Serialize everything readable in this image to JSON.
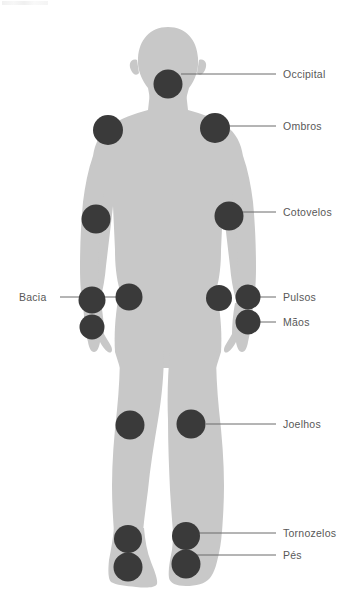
{
  "figure": {
    "body_color": "#c8c8c8",
    "marker_color": "#3a3a3a",
    "label_color": "#585858",
    "leader_color": "#6a6a6a",
    "background": "#ffffff"
  },
  "labels": [
    {
      "id": "occipital",
      "text": "Occipital",
      "side": "right",
      "x": 283,
      "y": 69,
      "line": {
        "x1": 181,
        "y1": 74,
        "x2": 276,
        "y2": 74
      }
    },
    {
      "id": "ombros",
      "text": "Ombros",
      "side": "right",
      "x": 283,
      "y": 121,
      "line": {
        "x1": 224,
        "y1": 126,
        "x2": 276,
        "y2": 126
      }
    },
    {
      "id": "cotovelos",
      "text": "Cotovelos",
      "side": "right",
      "x": 283,
      "y": 207,
      "line": {
        "x1": 239,
        "y1": 212,
        "x2": 276,
        "y2": 212
      }
    },
    {
      "id": "pulsos",
      "text": "Pulsos",
      "side": "right",
      "x": 283,
      "y": 292,
      "line": {
        "x1": 258,
        "y1": 297,
        "x2": 276,
        "y2": 297
      }
    },
    {
      "id": "maos",
      "text": "Mãos",
      "side": "right",
      "x": 283,
      "y": 317,
      "line": {
        "x1": 258,
        "y1": 322,
        "x2": 276,
        "y2": 322
      }
    },
    {
      "id": "joelhos",
      "text": "Joelhos",
      "side": "right",
      "x": 283,
      "y": 419,
      "line": {
        "x1": 206,
        "y1": 424,
        "x2": 276,
        "y2": 424
      }
    },
    {
      "id": "tornozelos",
      "text": "Tornozelos",
      "side": "right",
      "x": 283,
      "y": 528,
      "line": {
        "x1": 198,
        "y1": 533,
        "x2": 276,
        "y2": 533
      }
    },
    {
      "id": "pes",
      "text": "Pés",
      "side": "right",
      "x": 283,
      "y": 550,
      "line": {
        "x1": 196,
        "y1": 555,
        "x2": 276,
        "y2": 555
      }
    },
    {
      "id": "bacia",
      "text": "Bacia",
      "side": "left",
      "x": 19,
      "y": 292,
      "line": {
        "x1": 60,
        "y1": 297,
        "x2": 118,
        "y2": 297
      }
    }
  ],
  "markers": [
    {
      "id": "marker-occipital",
      "region": "Occipital",
      "cx": 168,
      "cy": 84,
      "r": 14.5
    },
    {
      "id": "marker-shoulder-left",
      "region": "Ombros",
      "cx": 108,
      "cy": 130,
      "r": 15
    },
    {
      "id": "marker-shoulder-right",
      "region": "Ombros",
      "cx": 215,
      "cy": 128,
      "r": 15
    },
    {
      "id": "marker-elbow-left",
      "region": "Cotovelos",
      "cx": 96,
      "cy": 219,
      "r": 14.5
    },
    {
      "id": "marker-elbow-right",
      "region": "Cotovelos",
      "cx": 229,
      "cy": 216,
      "r": 14.5
    },
    {
      "id": "marker-hip-left",
      "region": "Bacia",
      "cx": 129,
      "cy": 297,
      "r": 13.5
    },
    {
      "id": "marker-hip-right",
      "region": "Bacia",
      "cx": 92,
      "cy": 300,
      "r": 13.5
    },
    {
      "id": "marker-wrist-left",
      "region": "Pulsos",
      "cx": 219,
      "cy": 298,
      "r": 13
    },
    {
      "id": "marker-wrist-right",
      "region": "Pulsos",
      "cx": 248,
      "cy": 297,
      "r": 12.5
    },
    {
      "id": "marker-hand-left",
      "region": "Mãos",
      "cx": 92,
      "cy": 327,
      "r": 12.5
    },
    {
      "id": "marker-hand-right",
      "region": "Mãos",
      "cx": 248,
      "cy": 322,
      "r": 12.5
    },
    {
      "id": "marker-knee-left",
      "region": "Joelhos",
      "cx": 130,
      "cy": 425,
      "r": 14.5
    },
    {
      "id": "marker-knee-right",
      "region": "Joelhos",
      "cx": 191,
      "cy": 424,
      "r": 14.5
    },
    {
      "id": "marker-ankle-left",
      "region": "Tornozelos",
      "cx": 128,
      "cy": 539,
      "r": 14
    },
    {
      "id": "marker-ankle-right",
      "region": "Tornozelos",
      "cx": 186,
      "cy": 536,
      "r": 14
    },
    {
      "id": "marker-foot-left",
      "region": "Pés",
      "cx": 128,
      "cy": 567,
      "r": 14.5
    },
    {
      "id": "marker-foot-right",
      "region": "Pés",
      "cx": 186,
      "cy": 564,
      "r": 14.5
    }
  ]
}
